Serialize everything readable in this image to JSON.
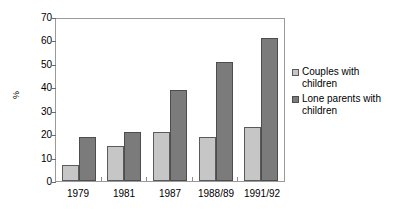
{
  "chart_data": {
    "type": "bar",
    "title": "",
    "xlabel": "",
    "ylabel": "%",
    "categories": [
      "1979",
      "1981",
      "1987",
      "1988/89",
      "1991/92"
    ],
    "series": [
      {
        "name": "Couples with children",
        "values": [
          7,
          15,
          21,
          19,
          23
        ],
        "color": "#c6c6c6"
      },
      {
        "name": "Lone parents with children",
        "values": [
          19,
          21,
          39,
          51,
          61
        ],
        "color": "#7b7b7b"
      }
    ],
    "ylim": [
      0,
      70
    ],
    "yticks": [
      0,
      10,
      20,
      30,
      40,
      50,
      60,
      70
    ],
    "grid": false,
    "legend_position": "right"
  },
  "legend": {
    "items": [
      {
        "label": "Couples with children"
      },
      {
        "label": "Lone parents with children"
      }
    ]
  }
}
